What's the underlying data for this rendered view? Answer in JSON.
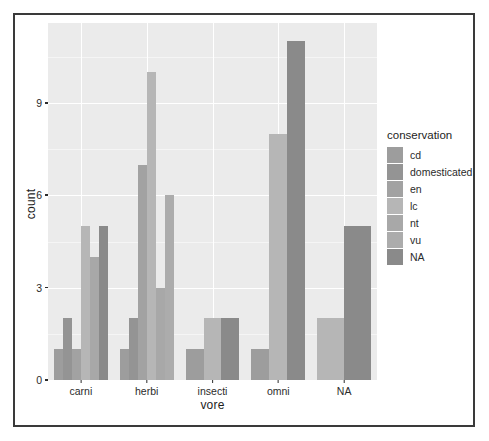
{
  "chart_data": {
    "type": "bar",
    "title": "",
    "subtitle": "",
    "xlabel": "vore",
    "ylabel": "count",
    "categories": [
      "carni",
      "herbi",
      "insecti",
      "omni",
      "NA"
    ],
    "group_label": "conservation",
    "legend_position": "right",
    "grid": true,
    "ylim": [
      0,
      11.6
    ],
    "yticks": [
      0,
      3,
      6,
      9
    ],
    "ytick_labels": [
      "0",
      "3",
      "6",
      "9"
    ],
    "series": [
      {
        "name": "cd",
        "color": "#9d9d9d",
        "values": [
          1,
          1,
          1,
          1,
          0
        ]
      },
      {
        "name": "domesticated",
        "color": "#949494",
        "values": [
          2,
          2,
          0,
          0,
          0
        ]
      },
      {
        "name": "en",
        "color": "#a2a2a2",
        "values": [
          1,
          7,
          0,
          0,
          0
        ]
      },
      {
        "name": "lc",
        "color": "#b6b6b6",
        "values": [
          5,
          10,
          2,
          8,
          2
        ]
      },
      {
        "name": "nt",
        "color": "#a8a8a8",
        "values": [
          4,
          3,
          0,
          0,
          0
        ]
      },
      {
        "name": "vu",
        "color": "#acacac",
        "values": [
          0,
          6,
          0,
          0,
          0
        ]
      },
      {
        "name": "NA",
        "color": "#8a8a8a",
        "values": [
          5,
          0,
          2,
          11,
          5
        ]
      }
    ],
    "annotations": []
  },
  "figure": {
    "panel_bg": "#ebebeb",
    "grid_color": "#ffffff",
    "frame_color": "#3a3a3a",
    "axis_text_color": "#2b2b2b"
  }
}
